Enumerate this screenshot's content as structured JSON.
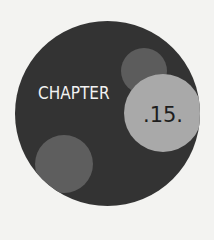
{
  "chapter": {
    "label": "CHAPTER",
    "number": ".15."
  },
  "colors": {
    "page_background": "#f3f3f1",
    "badge_background": "#333333",
    "accent_dot_dark": "#5c5c5c",
    "accent_dot_light": "#a9a9a9",
    "label_text": "#f2f2f2",
    "number_text": "#1e1e1e"
  }
}
